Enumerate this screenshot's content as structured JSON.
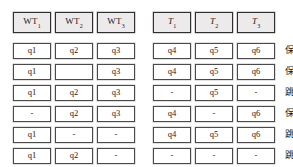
{
  "figure": {
    "caption": "",
    "colors": {
      "header_fill": "#eceaea",
      "header_border": "#303030",
      "cell_fill": "#ffffff",
      "cell_border": "#4a4a4a",
      "text": "#1b1b1b",
      "page_background": "#ffffff"
    }
  },
  "headers": {
    "wt_group": [
      {
        "base": "WT",
        "sub": "1"
      },
      {
        "base": "WT",
        "sub": "2"
      },
      {
        "base": "WT",
        "sub": "3"
      }
    ],
    "t_group": [
      {
        "base": "T",
        "sub": "1"
      },
      {
        "base": "T",
        "sub": "2"
      },
      {
        "base": "T",
        "sub": "3"
      }
    ]
  },
  "rows": [
    {
      "wt": [
        "q1",
        "q2",
        "q3"
      ],
      "t": [
        "q4",
        "q5",
        "q6"
      ],
      "status": "保存"
    },
    {
      "wt": [
        "q1",
        "",
        "q3"
      ],
      "t": [
        "q4",
        "q5",
        "q6"
      ],
      "status": "保存"
    },
    {
      "wt": [
        "q1",
        "q2",
        "q3"
      ],
      "t": [
        "-",
        "q5",
        "-"
      ],
      "status": "跳过"
    },
    {
      "wt": [
        "-",
        "q2",
        "q3"
      ],
      "t": [
        "q4",
        "-",
        "q6"
      ],
      "status": "保存"
    },
    {
      "wt": [
        "q1",
        "-",
        "-"
      ],
      "t": [
        "q4",
        "q5",
        "q6"
      ],
      "status": "跳过"
    },
    {
      "wt": [
        "q1",
        "q2",
        "-"
      ],
      "t": [
        "-",
        "-",
        "-"
      ],
      "status": "跳过"
    }
  ]
}
